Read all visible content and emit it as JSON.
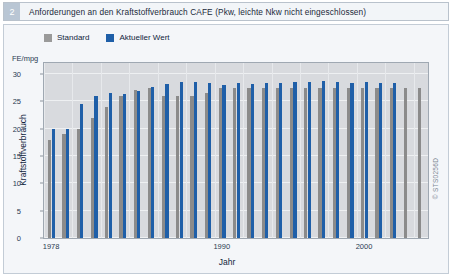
{
  "header": {
    "number": "2",
    "title": "Anforderungen an den Kraftstoffverbrauch CAFE (Pkw, leichte Nkw nicht eingeschlossen)"
  },
  "side_code": "© STS0256D",
  "colors": {
    "standard": "#8b8b8b",
    "aktueller_wert": "#1f5fa8",
    "plot_background": "#d8dade",
    "plate_background": "#f4f6f9",
    "header_accent": "#b9c6d4"
  },
  "chart_data": {
    "type": "bar",
    "title": "Anforderungen an den Kraftstoffverbrauch CAFE (Pkw, leichte Nkw nicht eingeschlossen)",
    "xlabel": "Jahr",
    "ylabel": "Kraftstoffverbrauch",
    "yunit": "FE/mpg",
    "ylim": [
      0,
      32
    ],
    "yticks": [
      0,
      5,
      10,
      15,
      20,
      25,
      30
    ],
    "grid": true,
    "legend_position": "top-left",
    "xticks": [
      "1978",
      "1990",
      "2000"
    ],
    "xtick_categories": [
      "1978",
      "1990",
      "2000"
    ],
    "categories": [
      "1978",
      "1979",
      "1980",
      "1981",
      "1982",
      "1983",
      "1984",
      "1985",
      "1986",
      "1987",
      "1988",
      "1989",
      "1990",
      "1991",
      "1992",
      "1993",
      "1994",
      "1995",
      "1996",
      "1997",
      "1998",
      "1999",
      "2000",
      "2001",
      "2002",
      "2003",
      "2004"
    ],
    "series": [
      {
        "name": "Standard",
        "values": [
          18.0,
          19.0,
          20.0,
          22.0,
          24.0,
          26.0,
          27.0,
          27.5,
          26.0,
          26.0,
          26.0,
          26.5,
          27.5,
          27.5,
          27.5,
          27.5,
          27.5,
          27.5,
          27.5,
          27.5,
          27.5,
          27.5,
          27.5,
          27.5,
          27.5,
          27.5,
          27.5
        ]
      },
      {
        "name": "Aktueller Wert",
        "values": [
          20.0,
          20.0,
          24.5,
          25.9,
          26.6,
          26.4,
          26.9,
          27.6,
          28.2,
          28.5,
          28.6,
          28.4,
          28.0,
          28.4,
          28.1,
          28.4,
          28.3,
          28.6,
          28.5,
          28.7,
          28.6,
          28.3,
          28.5,
          28.4,
          28.4,
          null,
          null
        ]
      }
    ]
  },
  "legend": {
    "items": [
      {
        "label": "Standard",
        "color": "#8b8b8b"
      },
      {
        "label": "Aktueller Wert",
        "color": "#1f5fa8"
      }
    ]
  }
}
